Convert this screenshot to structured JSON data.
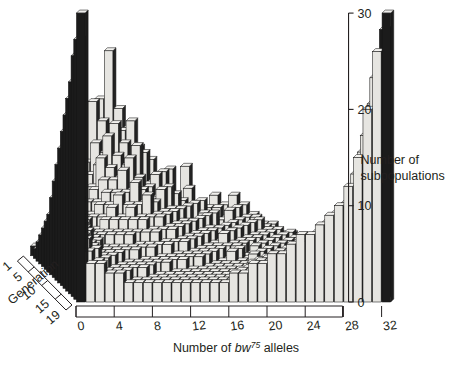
{
  "figure": {
    "name": "three-dimensional-histogram",
    "background": "#ffffff",
    "ink": "#231f20"
  },
  "colors": {
    "wall_top_face": "#f0efed",
    "wall_front_face": "#e9e8e4",
    "wall_dark": "#1b1b1b",
    "bar_front": "#e6e5e1",
    "bar_side": "#232323",
    "bar_top": "#f2f1ee",
    "outline": "#161616",
    "floor": "#ffffff",
    "text": "#231f20"
  },
  "chart_data": {
    "type": "bar",
    "title": "",
    "subtitle": "",
    "xlabel": "Number of bw75 alleles",
    "xlabel_parts": {
      "prefix": "Number of ",
      "italic": "bw",
      "superscript": "75",
      "suffix": " alleles"
    },
    "ylabel": "Number of subpopulations",
    "zlabel": "Generation",
    "xlim": [
      0,
      32
    ],
    "ylim": [
      0,
      30
    ],
    "zlim": [
      1,
      19
    ],
    "xticks": [
      0,
      4,
      8,
      12,
      16,
      20,
      24,
      28,
      32
    ],
    "yticks": [
      0,
      10,
      20,
      30
    ],
    "zticks": [
      1,
      5,
      10,
      15,
      19
    ],
    "grid": false,
    "legend": false,
    "projection": "3d-isometric",
    "x_categories": [
      0,
      1,
      2,
      3,
      4,
      5,
      6,
      7,
      8,
      9,
      10,
      11,
      12,
      13,
      14,
      15,
      16,
      17,
      18,
      19,
      20,
      21,
      22,
      23,
      24,
      25,
      26,
      27,
      28,
      29,
      30,
      31,
      32
    ],
    "series_axis": "Generation",
    "series": [
      {
        "name": "1",
        "values": [
          0,
          1,
          2,
          3,
          5,
          8,
          11,
          16,
          21,
          15,
          13,
          11,
          9,
          8,
          7,
          6,
          9,
          5,
          4,
          6,
          5,
          6,
          5,
          4,
          3,
          3,
          2,
          2,
          1,
          1,
          1,
          0,
          0
        ]
      },
      {
        "name": "2",
        "values": [
          1,
          1,
          2,
          4,
          6,
          9,
          16,
          14,
          12,
          13,
          14,
          9,
          10,
          7,
          9,
          5,
          7,
          4,
          5,
          5,
          4,
          5,
          4,
          4,
          3,
          2,
          2,
          2,
          1,
          1,
          1,
          1,
          1
        ]
      },
      {
        "name": "3",
        "values": [
          1,
          2,
          3,
          5,
          7,
          10,
          12,
          11,
          14,
          12,
          10,
          11,
          8,
          9,
          6,
          6,
          5,
          6,
          4,
          4,
          5,
          4,
          3,
          4,
          3,
          3,
          2,
          2,
          2,
          1,
          1,
          1,
          1
        ]
      },
      {
        "name": "4",
        "values": [
          2,
          2,
          4,
          6,
          8,
          9,
          10,
          13,
          11,
          10,
          12,
          8,
          9,
          6,
          7,
          5,
          6,
          5,
          5,
          3,
          4,
          3,
          4,
          3,
          3,
          2,
          3,
          2,
          2,
          2,
          1,
          1,
          2
        ]
      },
      {
        "name": "5",
        "values": [
          3,
          3,
          4,
          5,
          7,
          8,
          11,
          10,
          9,
          11,
          9,
          8,
          7,
          8,
          5,
          6,
          4,
          5,
          3,
          4,
          3,
          4,
          3,
          3,
          2,
          3,
          2,
          3,
          2,
          2,
          2,
          2,
          3
        ]
      },
      {
        "name": "6",
        "values": [
          4,
          3,
          5,
          6,
          6,
          8,
          9,
          9,
          10,
          8,
          8,
          7,
          8,
          6,
          6,
          4,
          5,
          4,
          4,
          3,
          4,
          3,
          3,
          2,
          3,
          2,
          3,
          2,
          3,
          2,
          2,
          3,
          4
        ]
      },
      {
        "name": "7",
        "values": [
          5,
          4,
          5,
          5,
          7,
          7,
          8,
          8,
          8,
          9,
          7,
          7,
          6,
          6,
          5,
          5,
          4,
          4,
          3,
          4,
          3,
          3,
          2,
          3,
          2,
          3,
          2,
          3,
          3,
          3,
          3,
          4,
          5
        ]
      },
      {
        "name": "8",
        "values": [
          6,
          5,
          5,
          6,
          6,
          7,
          7,
          8,
          7,
          7,
          8,
          6,
          6,
          5,
          5,
          4,
          4,
          3,
          4,
          3,
          3,
          2,
          3,
          2,
          3,
          2,
          3,
          3,
          3,
          3,
          4,
          5,
          7
        ]
      },
      {
        "name": "9",
        "values": [
          8,
          5,
          6,
          5,
          6,
          6,
          7,
          6,
          7,
          6,
          6,
          6,
          5,
          5,
          4,
          4,
          3,
          3,
          3,
          3,
          2,
          3,
          2,
          3,
          2,
          3,
          3,
          3,
          4,
          4,
          5,
          6,
          9
        ]
      },
      {
        "name": "10",
        "values": [
          10,
          6,
          6,
          6,
          5,
          6,
          6,
          6,
          6,
          6,
          5,
          5,
          5,
          4,
          4,
          3,
          3,
          3,
          2,
          3,
          2,
          2,
          3,
          2,
          3,
          3,
          3,
          4,
          4,
          5,
          6,
          8,
          11
        ]
      },
      {
        "name": "11",
        "values": [
          12,
          6,
          6,
          5,
          5,
          5,
          5,
          5,
          5,
          5,
          5,
          4,
          4,
          4,
          3,
          3,
          3,
          2,
          3,
          2,
          2,
          3,
          2,
          3,
          3,
          3,
          4,
          4,
          5,
          6,
          7,
          9,
          13
        ]
      },
      {
        "name": "12",
        "values": [
          14,
          7,
          6,
          5,
          5,
          5,
          5,
          5,
          4,
          4,
          4,
          4,
          3,
          3,
          3,
          3,
          2,
          2,
          2,
          2,
          3,
          2,
          3,
          3,
          3,
          4,
          4,
          5,
          5,
          6,
          8,
          11,
          15
        ]
      },
      {
        "name": "13",
        "values": [
          16,
          7,
          6,
          5,
          4,
          4,
          4,
          4,
          4,
          4,
          3,
          3,
          3,
          3,
          3,
          2,
          2,
          2,
          2,
          2,
          2,
          3,
          3,
          3,
          4,
          4,
          5,
          5,
          6,
          7,
          9,
          12,
          17
        ]
      },
      {
        "name": "14",
        "values": [
          18,
          7,
          6,
          5,
          4,
          4,
          4,
          4,
          3,
          3,
          3,
          3,
          3,
          2,
          2,
          2,
          2,
          2,
          2,
          2,
          3,
          3,
          3,
          4,
          4,
          5,
          5,
          6,
          7,
          8,
          10,
          14,
          19
        ]
      },
      {
        "name": "15",
        "values": [
          20,
          7,
          5,
          4,
          4,
          4,
          3,
          3,
          3,
          3,
          3,
          2,
          2,
          2,
          2,
          2,
          2,
          2,
          2,
          3,
          3,
          3,
          4,
          4,
          5,
          5,
          6,
          6,
          7,
          9,
          12,
          16,
          21
        ]
      },
      {
        "name": "16",
        "values": [
          22,
          6,
          5,
          4,
          4,
          3,
          3,
          3,
          3,
          2,
          2,
          2,
          2,
          2,
          2,
          2,
          2,
          2,
          2,
          3,
          3,
          4,
          4,
          5,
          5,
          6,
          6,
          7,
          8,
          10,
          13,
          18,
          23
        ]
      },
      {
        "name": "17",
        "values": [
          25,
          6,
          5,
          4,
          3,
          3,
          3,
          3,
          2,
          2,
          2,
          2,
          2,
          2,
          2,
          2,
          2,
          2,
          3,
          3,
          4,
          4,
          5,
          5,
          6,
          6,
          7,
          8,
          9,
          11,
          15,
          20,
          25
        ]
      },
      {
        "name": "18",
        "values": [
          27,
          5,
          4,
          3,
          3,
          3,
          2,
          2,
          2,
          2,
          2,
          2,
          2,
          2,
          2,
          2,
          2,
          3,
          3,
          4,
          4,
          5,
          5,
          6,
          6,
          7,
          8,
          9,
          10,
          13,
          17,
          23,
          28
        ]
      },
      {
        "name": "19",
        "values": [
          30,
          4,
          4,
          3,
          3,
          2,
          2,
          2,
          2,
          2,
          2,
          2,
          2,
          2,
          2,
          2,
          3,
          3,
          4,
          4,
          5,
          5,
          6,
          7,
          7,
          8,
          9,
          10,
          12,
          15,
          20,
          26,
          30
        ]
      }
    ]
  },
  "axes": {
    "x": {
      "label": "Number of bw75 alleles",
      "tick_labels": [
        "0",
        "4",
        "8",
        "12",
        "16",
        "20",
        "24",
        "28",
        "32"
      ]
    },
    "y": {
      "label_line1": "Number of",
      "label_line2": "subpopulations",
      "tick_labels": [
        "0",
        "10",
        "20",
        "30"
      ]
    },
    "z": {
      "label": "Generation",
      "tick_labels": [
        "1",
        "5",
        "10",
        "15",
        "19"
      ]
    }
  }
}
